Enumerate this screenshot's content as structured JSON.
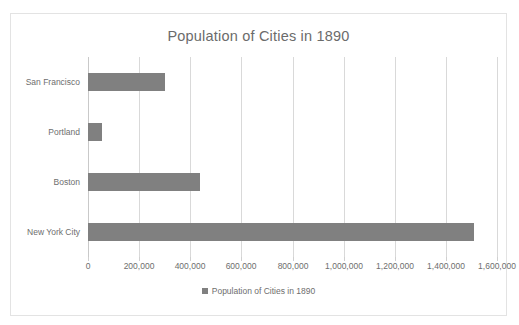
{
  "chart_data": {
    "type": "bar",
    "orientation": "horizontal",
    "title": "Population of Cities in 1890",
    "xlabel": "",
    "ylabel": "",
    "categories": [
      "San Francisco",
      "Portland",
      "Boston",
      "New York City"
    ],
    "values": [
      300000,
      55000,
      440000,
      1510000
    ],
    "series": [
      {
        "name": "Population of Cities in 1890",
        "values": [
          300000,
          55000,
          440000,
          1510000
        ],
        "color": "#808080"
      }
    ],
    "xlim": [
      0,
      1600000
    ],
    "xticks": [
      0,
      200000,
      400000,
      600000,
      800000,
      1000000,
      1200000,
      1400000,
      1600000
    ],
    "xtick_labels": [
      "0",
      "200,000",
      "400,000",
      "600,000",
      "800,000",
      "1,000,000",
      "1,200,000",
      "1,400,000",
      "1,600,000"
    ],
    "grid": "vertical",
    "legend": {
      "position": "bottom",
      "entries": [
        "Population of Cities in 1890"
      ],
      "swatch_icon": "square-swatch-icon"
    },
    "colors": {
      "bar": "#808080",
      "gridline": "#d9d9d9",
      "axis": "#c9c9c9",
      "text": "#6e6e6e",
      "title_text": "#6b6b6b",
      "frame_border": "#e3e3e3",
      "background": "#ffffff"
    }
  }
}
